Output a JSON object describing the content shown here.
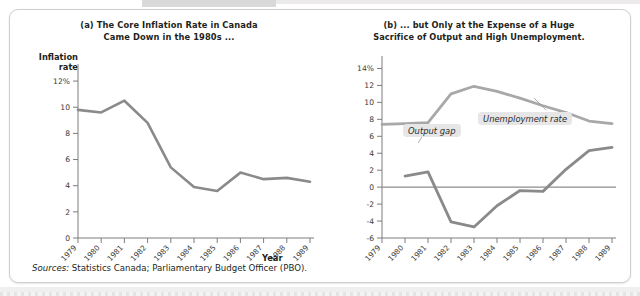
{
  "figure": {
    "source_label": "Sources:",
    "source_text": "Statistics Canada; Parliamentary Budget Officer (PBO)."
  },
  "panel_a": {
    "title_line1": "(a) The Core Inflation Rate in Canada",
    "title_line2": "Came Down in the 1980s ...",
    "y_axis_name_line1": "Inflation",
    "y_axis_name_line2": "rate",
    "x_axis_name": "Year"
  },
  "panel_b": {
    "title_line1": "(b) ... but Only at the Expense of a Huge",
    "title_line2": "Sacrifice of Output and High Unemployment.",
    "x_axis_name": "Year",
    "callout_unemployment": "Unemployment rate",
    "callout_output_gap": "Output gap"
  },
  "colors": {
    "inflation_line": "#8a8a8a",
    "unemployment_line": "#a8a8a8",
    "output_gap_line": "#8a8a8a",
    "axis": "#7d7d7d",
    "frame": "#cfcfcf",
    "callout_background": "#e6e6e6"
  },
  "chart_data": [
    {
      "type": "line",
      "title": "(a) The Core Inflation Rate in Canada Came Down in the 1980s ...",
      "xlabel": "Year",
      "ylabel": "Inflation rate",
      "ylim": [
        0,
        13
      ],
      "yticks": [
        0,
        2,
        4,
        6,
        8,
        10,
        12
      ],
      "ytick_labels": [
        "0",
        "2",
        "4",
        "6",
        "8",
        "10",
        "12%"
      ],
      "grid": false,
      "legend": "none",
      "x": [
        1979,
        1980,
        1981,
        1982,
        1983,
        1984,
        1985,
        1986,
        1987,
        1988,
        1989
      ],
      "xtick_labels": [
        "1979",
        "1980",
        "1981",
        "1982",
        "1983",
        "1984",
        "1985",
        "1986",
        "1987",
        "1988",
        "1989"
      ],
      "series": [
        {
          "name": "Core inflation rate",
          "values": [
            9.8,
            9.6,
            10.5,
            8.8,
            5.4,
            3.9,
            3.6,
            5.0,
            4.5,
            4.6,
            4.3
          ]
        }
      ]
    },
    {
      "type": "line",
      "title": "(b) ... but Only at the Expense of a Huge Sacrifice of Output and High Unemployment.",
      "xlabel": "Year",
      "ylabel": "",
      "ylim": [
        -6,
        15
      ],
      "yticks": [
        -6,
        -4,
        -2,
        0,
        2,
        4,
        6,
        8,
        10,
        12,
        14
      ],
      "ytick_labels": [
        "-6",
        "-4",
        "-2",
        "0",
        "2",
        "4",
        "6",
        "8",
        "10",
        "12",
        "14%"
      ],
      "grid": false,
      "legend": "inline-callouts",
      "x": [
        1979,
        1980,
        1981,
        1982,
        1983,
        1984,
        1985,
        1986,
        1987,
        1988,
        1989
      ],
      "xtick_labels": [
        "1979",
        "1980",
        "1981",
        "1982",
        "1983",
        "1984",
        "1985",
        "1986",
        "1987",
        "1988",
        "1989"
      ],
      "series": [
        {
          "name": "Unemployment rate",
          "values": [
            7.4,
            7.5,
            7.6,
            11.0,
            11.9,
            11.3,
            10.5,
            9.6,
            8.8,
            7.8,
            7.5
          ]
        },
        {
          "name": "Output gap",
          "x": [
            1980,
            1981,
            1982,
            1983,
            1984,
            1985,
            1986,
            1987,
            1988,
            1989
          ],
          "values": [
            1.3,
            1.8,
            -4.1,
            -4.7,
            -2.2,
            -0.4,
            -0.5,
            2.1,
            4.3,
            4.7
          ]
        }
      ],
      "annotations": [
        {
          "text": "Unemployment rate",
          "points_to_series": "Unemployment rate"
        },
        {
          "text": "Output gap",
          "points_to_series": "Output gap"
        }
      ]
    }
  ]
}
